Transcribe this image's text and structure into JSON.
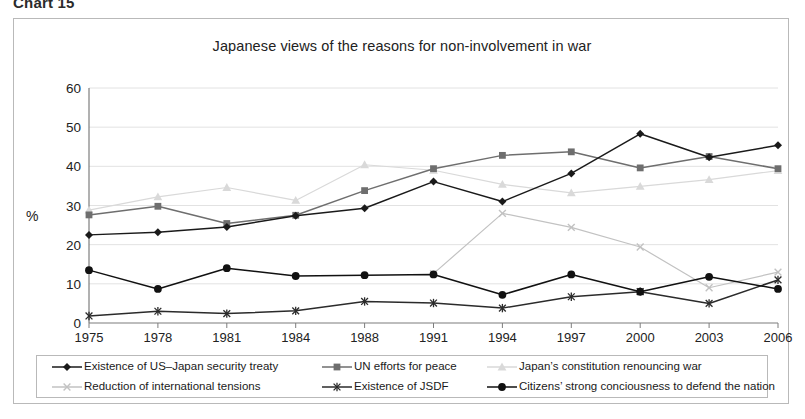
{
  "caption": "Chart 15",
  "chart_title": "Japanese views of the reasons for non-involvement in war",
  "axis": {
    "ylabel": "%",
    "yticks": [
      "60",
      "50",
      "40",
      "30",
      "20",
      "10",
      "0"
    ]
  },
  "colors": {
    "treaty": "#1a1a1a",
    "un_efforts": "#6e6e6e",
    "constitution": "#d9d9d9",
    "tensions": "#c2c2c2",
    "jsdf": "#2b2b2b",
    "citizens": "#111111",
    "gridline": "#e2e2e2",
    "axis": "#7d7d7d",
    "frame_border": "#b9b9b9"
  },
  "legend": {
    "items": [
      {
        "label": "Existence of US–Japan security treaty",
        "marker": "diamond-marker",
        "color": "#1a1a1a"
      },
      {
        "label": "UN efforts for peace",
        "marker": "square-marker",
        "color": "#6e6e6e"
      },
      {
        "label": "Japan’s constitution renouncing war",
        "marker": "triangle-marker",
        "color": "#d9d9d9"
      },
      {
        "label": "Reduction of international tensions",
        "marker": "cross-x-marker",
        "color": "#c2c2c2"
      },
      {
        "label": "Existence of JSDF",
        "marker": "asterisk-marker",
        "color": "#2b2b2b"
      },
      {
        "label": "Citizens’ strong conciousness to defend the nation",
        "marker": "circle-marker",
        "color": "#111111"
      }
    ]
  },
  "chart_data": {
    "type": "line",
    "title": "Japanese views of the reasons for non-involvement in war",
    "xlabel": "",
    "ylabel": "%",
    "ylim": [
      0,
      60
    ],
    "ytick_step": 10,
    "grid": true,
    "legend_position": "bottom",
    "categories": [
      "1975",
      "1978",
      "1981",
      "1984",
      "1988",
      "1991",
      "1994",
      "1997",
      "2000",
      "2003",
      "2006"
    ],
    "series": [
      {
        "name": "Existence of US–Japan security treaty",
        "marker": "diamond",
        "color": "#1a1a1a",
        "values": [
          22.5,
          23.2,
          24.5,
          27.4,
          29.3,
          36.1,
          31.0,
          38.2,
          48.3,
          42.3,
          45.4
        ]
      },
      {
        "name": "UN efforts for peace",
        "marker": "square",
        "color": "#6e6e6e",
        "values": [
          27.6,
          29.8,
          25.4,
          27.5,
          33.8,
          39.4,
          42.8,
          43.7,
          39.6,
          42.5,
          39.4
        ]
      },
      {
        "name": "Japan’s constitution renouncing war",
        "marker": "triangle",
        "color": "#d9d9d9",
        "values": [
          28.8,
          32.2,
          34.6,
          31.3,
          40.4,
          39.0,
          35.4,
          33.2,
          34.9,
          36.6,
          38.9
        ]
      },
      {
        "name": "Reduction of international tensions",
        "marker": "cross-x",
        "color": "#c2c2c2",
        "values": [
          null,
          null,
          null,
          null,
          null,
          12.6,
          28.0,
          24.4,
          19.4,
          9.0,
          13.0
        ]
      },
      {
        "name": "Existence of JSDF",
        "marker": "asterisk",
        "color": "#2b2b2b",
        "values": [
          1.8,
          3.0,
          2.4,
          3.1,
          5.5,
          5.1,
          3.8,
          6.7,
          8.0,
          5.0,
          11.0
        ]
      },
      {
        "name": "Citizens’ strong conciousness to defend the nation",
        "marker": "circle",
        "color": "#111111",
        "values": [
          13.5,
          8.7,
          14.0,
          12.0,
          12.2,
          12.4,
          7.2,
          12.4,
          8.0,
          11.8,
          8.7
        ]
      }
    ]
  }
}
